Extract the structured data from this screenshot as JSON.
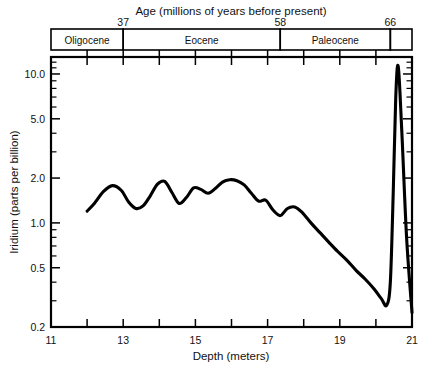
{
  "chart_data": {
    "type": "line",
    "title": "",
    "xlabel": "Depth (meters)",
    "ylabel": "Iridium (parts per billion)",
    "top_axis_label": "Age (millions of years before present)",
    "xlim": [
      11,
      21
    ],
    "ylim": [
      0.2,
      13.0
    ],
    "yscale": "log",
    "xscale": "linear",
    "grid": false,
    "legend": null,
    "x_major_ticks": [
      11,
      13,
      15,
      17,
      19,
      21
    ],
    "x_major_tick_labels": [
      "11",
      "13",
      "15",
      "17",
      "19",
      "21"
    ],
    "x_minor_ticks": [
      12,
      14,
      16,
      18,
      20
    ],
    "y_major_ticks": [
      0.2,
      0.5,
      1.0,
      2.0,
      5.0,
      10.0
    ],
    "y_major_tick_labels": [
      "0.2",
      "0.5",
      "1.0",
      "2.0",
      "5.0",
      "10.0"
    ],
    "y_minor_ticks": [
      0.3,
      0.4,
      0.6,
      0.7,
      0.8,
      0.9,
      3.0,
      4.0,
      6.0,
      7.0,
      8.0,
      9.0,
      11.0,
      12.0,
      13.0
    ],
    "epoch_axis": {
      "age_ticks": [
        37,
        58,
        66
      ],
      "age_tick_labels": [
        "37",
        "58",
        "66"
      ],
      "epochs": [
        {
          "label": "Oligocene",
          "depth_start": 11.0,
          "depth_end": 13.0
        },
        {
          "label": "Eocene",
          "depth_start": 13.0,
          "depth_end": 17.35
        },
        {
          "label": "Paleocene",
          "depth_start": 17.35,
          "depth_end": 20.4
        },
        {
          "label": "",
          "depth_start": 20.4,
          "depth_end": 21.0
        }
      ]
    },
    "series": [
      {
        "name": "Iridium abundance",
        "color": "#000000",
        "x": [
          12.0,
          12.2,
          12.45,
          12.7,
          12.95,
          13.15,
          13.35,
          13.55,
          13.75,
          13.95,
          14.15,
          14.35,
          14.55,
          14.75,
          14.95,
          15.15,
          15.35,
          15.55,
          15.75,
          15.95,
          16.15,
          16.35,
          16.55,
          16.75,
          16.95,
          17.15,
          17.35,
          17.55,
          17.75,
          17.95,
          18.2,
          18.45,
          18.7,
          18.95,
          19.2,
          19.45,
          19.7,
          19.95,
          20.15,
          20.3,
          20.4,
          20.48,
          20.55,
          20.62,
          20.72,
          20.85,
          21.0
        ],
        "y": [
          1.2,
          1.35,
          1.62,
          1.78,
          1.65,
          1.38,
          1.25,
          1.3,
          1.52,
          1.82,
          1.9,
          1.6,
          1.35,
          1.48,
          1.72,
          1.68,
          1.58,
          1.7,
          1.88,
          1.95,
          1.92,
          1.8,
          1.58,
          1.4,
          1.42,
          1.22,
          1.12,
          1.25,
          1.28,
          1.18,
          1.0,
          0.86,
          0.74,
          0.64,
          0.56,
          0.48,
          0.42,
          0.36,
          0.31,
          0.28,
          0.4,
          1.6,
          7.0,
          11.2,
          4.0,
          0.8,
          0.25
        ]
      }
    ],
    "annotations": []
  },
  "figure": {
    "background": "#ffffff",
    "line_color": "#000000",
    "text_color": "#000000"
  }
}
